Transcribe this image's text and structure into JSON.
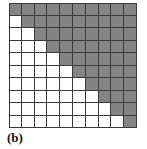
{
  "figure": {
    "caption": "(b)",
    "colors": {
      "shaded": "#848484",
      "empty": "#ffffff",
      "gridline": "#3a3a3a",
      "background": "#ffffff",
      "caption_text": "#111111"
    }
  },
  "chart_data": {
    "type": "heatmap",
    "title": "(b)",
    "xlabel": "",
    "ylabel": "",
    "rows": 10,
    "columns": 10,
    "grid": true,
    "legend": "",
    "value_labels": {
      "0": "empty",
      "1": "shaded"
    },
    "row_labels": [
      "1",
      "2",
      "3",
      "4",
      "5",
      "6",
      "7",
      "8",
      "9",
      "10"
    ],
    "column_labels": [
      "1",
      "2",
      "3",
      "4",
      "5",
      "6",
      "7",
      "8",
      "9",
      "10"
    ],
    "shaded_counts_per_row": [
      10,
      9,
      8,
      7,
      6,
      5,
      4,
      3,
      2,
      1
    ],
    "empty_counts_per_row": [
      0,
      1,
      2,
      3,
      4,
      5,
      6,
      7,
      8,
      9
    ],
    "values": [
      [
        1,
        1,
        1,
        1,
        1,
        1,
        1,
        1,
        1,
        1
      ],
      [
        0,
        1,
        1,
        1,
        1,
        1,
        1,
        1,
        1,
        1
      ],
      [
        0,
        0,
        1,
        1,
        1,
        1,
        1,
        1,
        1,
        1
      ],
      [
        0,
        0,
        0,
        1,
        1,
        1,
        1,
        1,
        1,
        1
      ],
      [
        0,
        0,
        0,
        0,
        1,
        1,
        1,
        1,
        1,
        1
      ],
      [
        0,
        0,
        0,
        0,
        0,
        1,
        1,
        1,
        1,
        1
      ],
      [
        0,
        0,
        0,
        0,
        0,
        0,
        1,
        1,
        1,
        1
      ],
      [
        0,
        0,
        0,
        0,
        0,
        0,
        0,
        1,
        1,
        1
      ],
      [
        0,
        0,
        0,
        0,
        0,
        0,
        0,
        0,
        1,
        1
      ],
      [
        0,
        0,
        0,
        0,
        0,
        0,
        0,
        0,
        0,
        1
      ]
    ]
  }
}
